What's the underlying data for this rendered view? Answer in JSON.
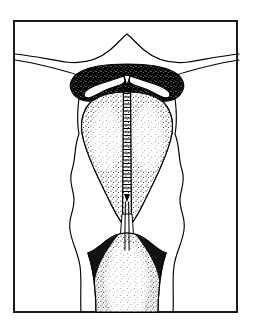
{
  "figure": {
    "title": "Coronal section of the uterus with an intrauterine device in place",
    "domain": "medical-line-drawing",
    "caption": "",
    "width": 254,
    "height": 328,
    "background_color": "#ffffff",
    "ink_color": "#000000",
    "style": "black-and-white stippled pen-and-ink anatomical illustration"
  },
  "frame": {
    "name": "figure-border",
    "x": 14,
    "y": 21,
    "width": 223,
    "height": 291,
    "stroke_color": "#1a1a1a",
    "stroke_width": 2,
    "fill_color": "#ffffff"
  },
  "structures": [
    {
      "id": "fallopian-tube-left",
      "label": "Left fallopian tube",
      "rendering": "thin outline, no fill",
      "stroke_color": "#000000"
    },
    {
      "id": "fallopian-tube-right",
      "label": "Right fallopian tube",
      "rendering": "thin outline, no fill",
      "stroke_color": "#000000"
    },
    {
      "id": "uterine-serosa",
      "label": "Uterine outer contour (serosa)",
      "rendering": "wavy thin outline, no fill",
      "stroke_color": "#000000"
    },
    {
      "id": "myometrium-fundus",
      "label": "Myometrium at fundus and cornua",
      "rendering": "solid black with fine white stipple",
      "fill_color": "#000000"
    },
    {
      "id": "endometrium-cavity",
      "label": "Endometrial cavity lining",
      "rendering": "dense black stipple on white, triangular cavity",
      "fill_color": "#ffffff",
      "stipple_color": "#000000"
    },
    {
      "id": "cervical-canal",
      "label": "Cervical canal",
      "rendering": "narrow white channel through isthmus",
      "fill_color": "#ffffff"
    },
    {
      "id": "cervix-body",
      "label": "Cervix",
      "rendering": "stippled column flaring at internal os, reaching lower border",
      "fill_color": "#ffffff",
      "stipple_color": "#000000"
    }
  ],
  "device": {
    "id": "intrauterine-device",
    "label": "Intrauterine device (IUD)",
    "shape": "T-shaped",
    "parts": [
      {
        "id": "iud-arm-left",
        "label": "Left transverse arm",
        "rendering": "white band outlined in black, lying along fundal roof"
      },
      {
        "id": "iud-arm-right",
        "label": "Right transverse arm",
        "rendering": "white band outlined in black, lying along fundal roof"
      },
      {
        "id": "iud-stem",
        "label": "Vertical stem with copper coil",
        "rendering": "ladder/coil rungs descending the midline of the cavity"
      },
      {
        "id": "iud-threads",
        "label": "Monofilament retrieval threads",
        "rendering": "two fine parallel lines descending through the cervical canal"
      }
    ]
  },
  "annotations": {
    "labels": [],
    "leader_lines": []
  }
}
